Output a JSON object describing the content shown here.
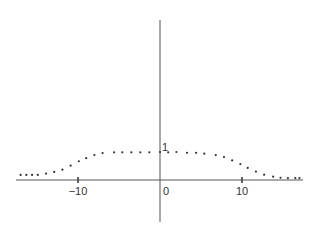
{
  "chart_data": {
    "type": "scatter",
    "title": "",
    "xlabel": "",
    "ylabel": "",
    "xlim": [
      -19.5,
      17.5
    ],
    "ylim": [
      -1.5,
      5.7
    ],
    "grid": false,
    "legend": null,
    "axes_style": "cross-at-origin",
    "x_ticks": [
      -10,
      0,
      10
    ],
    "x_tick_labels": [
      "−10",
      "0",
      "10"
    ],
    "y_ticks": [
      1
    ],
    "y_tick_labels": [
      "1"
    ],
    "series": [
      {
        "name": "points",
        "marker": "dot",
        "color": "#333333",
        "x": [
          -17,
          -16.3,
          -15.6,
          -14.9,
          -13.9,
          -12.9,
          -11.9,
          -10.9,
          -9.9,
          -9.0,
          -8.0,
          -7.0,
          -5.6,
          -4.6,
          -3.5,
          -2.4,
          -1.3,
          0,
          1,
          2,
          3.3,
          4.4,
          5.4,
          6.8,
          7.8,
          8.8,
          9.8,
          10.7,
          11.7,
          12.7,
          13.8,
          14.7,
          15.6,
          16.5,
          17
        ],
        "y": [
          0.18,
          0.18,
          0.18,
          0.18,
          0.23,
          0.29,
          0.37,
          0.51,
          0.67,
          0.78,
          0.89,
          0.96,
          0.99,
          0.99,
          0.99,
          0.99,
          0.99,
          1.0,
          0.99,
          1.0,
          0.97,
          0.97,
          0.94,
          0.89,
          0.82,
          0.7,
          0.57,
          0.43,
          0.3,
          0.19,
          0.12,
          0.08,
          0.07,
          0.07,
          0.07
        ]
      }
    ]
  },
  "layout": {
    "origin_px": [
      160,
      180
    ],
    "px_per_x_unit": 8.2,
    "px_per_y_unit": 28,
    "x_axis_px": [
      16,
      303
    ],
    "y_axis_px": [
      20,
      222
    ]
  }
}
